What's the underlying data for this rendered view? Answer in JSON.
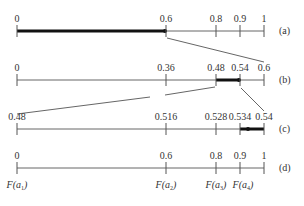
{
  "diagram": {
    "rows": [
      {
        "id": "a",
        "label": "(a)",
        "ticks": [
          "0",
          "0.6",
          "0.8",
          "0.9",
          "1"
        ],
        "highlight": {
          "from": "0",
          "to": "0.6"
        }
      },
      {
        "id": "b",
        "label": "(b)",
        "ticks": [
          "0",
          "0.36",
          "0.48",
          "0.54",
          "0.6"
        ],
        "highlight": {
          "from": "0.48",
          "to": "0.54"
        }
      },
      {
        "id": "c",
        "label": "(c)",
        "ticks": [
          "0.48",
          "0.516",
          "0.528",
          "0.534",
          "0.54"
        ],
        "highlight": {
          "from": "0.534",
          "to": "0.54"
        }
      },
      {
        "id": "d",
        "label": "(d)",
        "ticks": [
          "0",
          "0.6",
          "0.8",
          "0.9",
          "1"
        ],
        "f_labels": [
          {
            "base": "F(a",
            "sub": "1",
            "close": ")"
          },
          {
            "base": "F(a",
            "sub": "2",
            "close": ")"
          },
          {
            "base": "F(a",
            "sub": "3",
            "close": ")"
          },
          {
            "base": "F(a",
            "sub": "4",
            "close": ")"
          }
        ]
      }
    ],
    "colors": {
      "axis": "#555555",
      "highlight": "#111111",
      "connector": "#555555"
    }
  }
}
